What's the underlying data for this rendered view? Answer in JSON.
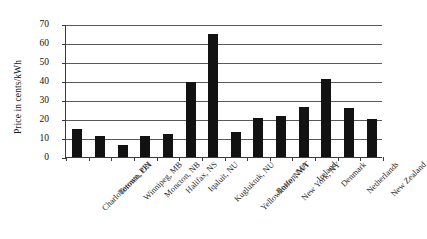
{
  "chart_data": {
    "type": "bar",
    "title": "",
    "xlabel": "",
    "ylabel": "Price in cents/kWh",
    "ylim": [
      0,
      70
    ],
    "ytick_step": 10,
    "yticks": [
      "70",
      "60",
      "50",
      "40",
      "30",
      "20",
      "10",
      "0"
    ],
    "grid": true,
    "legend": "none",
    "bar_color": "#121212",
    "categories": [
      "Charlottetown, PEI",
      "Toronto, ON",
      "Winnipeg, MB",
      "Moncton, NB",
      "Halifax, NS",
      "Iqaluit, NU",
      "Kugluktuk, NU",
      "Yellowknife, NWT",
      "Boston, MA",
      "New York, NY",
      "Ireland",
      "Denmark",
      "Netherlands",
      "New Zealand"
    ],
    "values": [
      14.5,
      11,
      6.5,
      11.3,
      12,
      39.5,
      65,
      13,
      20.5,
      21.5,
      26.5,
      41,
      26,
      20
    ]
  }
}
